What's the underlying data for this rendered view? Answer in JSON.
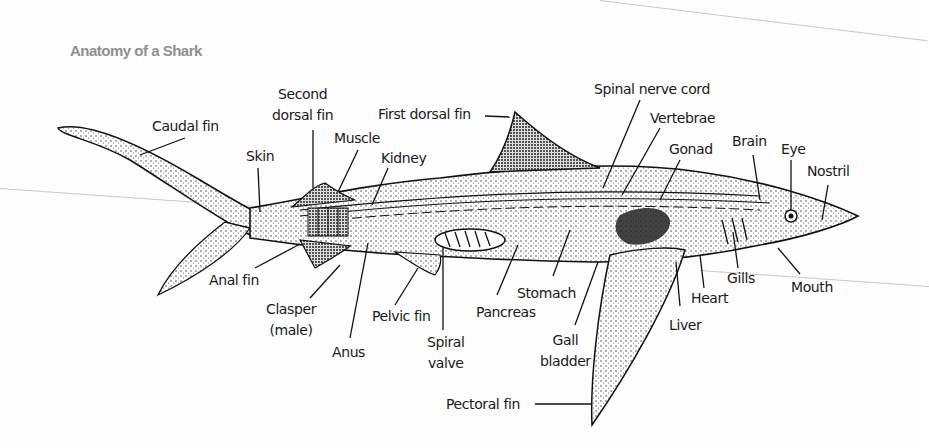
{
  "title": "Anatomy of a Shark",
  "colors": {
    "title": "#8f8f8f",
    "ink": "#1a1a1a",
    "background": "#fdfdfd"
  },
  "labels": {
    "caudal_fin": "Caudal fin",
    "skin": "Skin",
    "second_dorsal_fin_1": "Second",
    "second_dorsal_fin_2": "dorsal fin",
    "muscle": "Muscle",
    "kidney": "Kidney",
    "first_dorsal_fin": "First dorsal fin",
    "spinal_nerve_cord": "Spinal nerve cord",
    "vertebrae": "Vertebrae",
    "gonad": "Gonad",
    "brain": "Brain",
    "eye": "Eye",
    "nostril": "Nostril",
    "anal_fin": "Anal fin",
    "clasper_1": "Clasper",
    "clasper_2": "(male)",
    "anus": "Anus",
    "pelvic_fin": "Pelvic fin",
    "spiral_valve_1": "Spiral",
    "spiral_valve_2": "valve",
    "pancreas": "Pancreas",
    "stomach": "Stomach",
    "gall_bladder_1": "Gall",
    "gall_bladder_2": "bladder",
    "liver": "Liver",
    "heart": "Heart",
    "gills": "Gills",
    "mouth": "Mouth",
    "pectoral_fin": "Pectoral fin"
  }
}
